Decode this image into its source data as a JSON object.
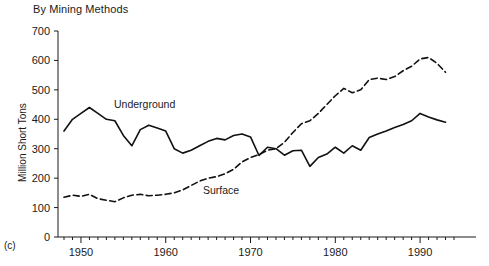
{
  "chart": {
    "title": "By Mining Methods",
    "panel_label": "(c)",
    "ylabel": "Million Short Tons",
    "annotations": [
      {
        "name": "underground",
        "text": "Underground"
      },
      {
        "name": "surface",
        "text": "Surface"
      }
    ]
  },
  "chart_data": {
    "type": "line",
    "title": "By Mining Methods",
    "xlabel": "",
    "ylabel": "Million Short Tons",
    "xlim": [
      1948,
      1994
    ],
    "ylim": [
      0,
      700
    ],
    "yticks": [
      0,
      100,
      200,
      300,
      400,
      500,
      600,
      700
    ],
    "xticks": [
      1950,
      1960,
      1970,
      1980,
      1990
    ],
    "xtick_minor_interval": 1,
    "grid": false,
    "legend": "inline-annotations",
    "x": [
      1948,
      1949,
      1950,
      1951,
      1952,
      1953,
      1954,
      1955,
      1956,
      1957,
      1958,
      1959,
      1960,
      1961,
      1962,
      1963,
      1964,
      1965,
      1966,
      1967,
      1968,
      1969,
      1970,
      1971,
      1972,
      1973,
      1974,
      1975,
      1976,
      1977,
      1978,
      1979,
      1980,
      1981,
      1982,
      1983,
      1984,
      1985,
      1986,
      1987,
      1988,
      1989,
      1990,
      1991,
      1992,
      1993
    ],
    "series": [
      {
        "name": "Underground",
        "style": "solid",
        "values": [
          360,
          400,
          420,
          440,
          420,
          400,
          395,
          345,
          310,
          365,
          380,
          370,
          360,
          300,
          285,
          295,
          310,
          325,
          335,
          330,
          345,
          350,
          340,
          277,
          305,
          300,
          278,
          293,
          295,
          240,
          270,
          282,
          305,
          285,
          310,
          295,
          338,
          350,
          360,
          372,
          382,
          395,
          420,
          408,
          398,
          390
        ]
      },
      {
        "name": "Surface",
        "style": "dashed",
        "values": [
          135,
          142,
          138,
          145,
          130,
          125,
          120,
          133,
          142,
          145,
          140,
          142,
          145,
          150,
          160,
          175,
          190,
          200,
          205,
          215,
          230,
          255,
          270,
          280,
          295,
          300,
          322,
          355,
          385,
          395,
          420,
          450,
          480,
          505,
          490,
          500,
          535,
          540,
          535,
          545,
          565,
          580,
          605,
          610,
          590,
          560
        ]
      }
    ]
  }
}
